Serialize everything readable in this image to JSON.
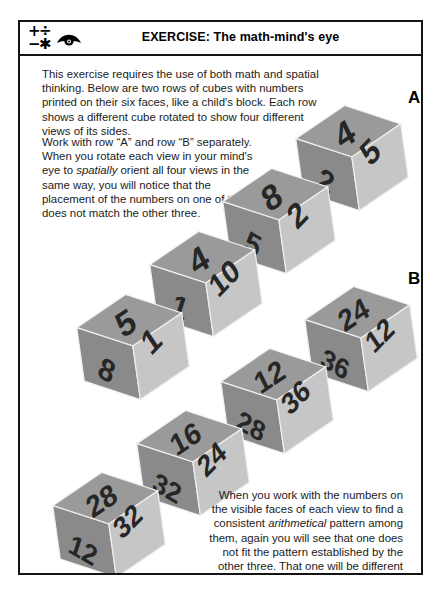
{
  "header": {
    "title": "EXERCISE: The math-mind's eye",
    "icons": {
      "math_symbols": [
        "+",
        "÷",
        "−",
        "✱"
      ],
      "math_icon_name": "math-operators-icon",
      "eye_icon_name": "eye-icon"
    }
  },
  "body": {
    "intro_paragraph": "This exercise requires the use of both math and spatial thinking. Below are two rows of cubes with numbers printed on their six faces, like a child's block. Each row shows a different cube rotated to show four different views of its sides.",
    "work_paragraph_parts": {
      "before_italic": "Work with row “A” and row “B” separately. When you rotate each view in your mind's eye to ",
      "italic": "spatially",
      "after_italic": " orient all four views in the same way, you will notice that the placement of the numbers on one of them does not match the other three."
    },
    "bottom_paragraph_parts": {
      "part1": "When you work with the numbers on the visible faces of each view to find a consistent ",
      "italic1": "arithmetical",
      "part2": " pattern among them, again you will see that one does not fit the pattern established by the other three. That one will be different from the ",
      "italic2": "spatially",
      "part3": " inconsistent one in that row."
    }
  },
  "rows": [
    {
      "label": "A",
      "cubes": [
        {
          "top": "4",
          "right": "5",
          "left": "2"
        },
        {
          "top": "8",
          "right": "2",
          "left": "5"
        },
        {
          "top": "4",
          "right": "10",
          "left": "1"
        },
        {
          "top": "5",
          "right": "1",
          "left": "8"
        }
      ]
    },
    {
      "label": "B",
      "cubes": [
        {
          "top": "24",
          "right": "12",
          "left": "36"
        },
        {
          "top": "12",
          "right": "36",
          "left": "28"
        },
        {
          "top": "16",
          "right": "24",
          "left": "32"
        },
        {
          "top": "28",
          "right": "32",
          "left": "12"
        }
      ]
    }
  ],
  "colors": {
    "border": "#141414",
    "text": "#1b1b1b",
    "face_top": "#9a9a9a",
    "face_left": "#8a8a8a",
    "face_right": "#c6c6c6",
    "numeral": "#262626"
  }
}
